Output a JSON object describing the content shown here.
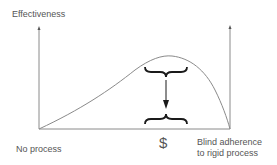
{
  "diagram": {
    "y_axis_label": "Effectiveness",
    "x_axis_left_label": "No process",
    "x_axis_right_label_line1": "Blind adherence",
    "x_axis_right_label_line2": "to rigid process",
    "cost_symbol": "$",
    "colors": {
      "axis": "#8a8a8a",
      "curve": "#8a8a8a",
      "brace": "#1a1a1a",
      "arrow": "#1a1a1a",
      "text": "#555555"
    },
    "curve_description": "Effectiveness rises with process, peaks, then drops sharply toward blind adherence to rigid process",
    "annotation": "Brace at peak effectiveness with downward arrow to brace at baseline labeled $"
  }
}
